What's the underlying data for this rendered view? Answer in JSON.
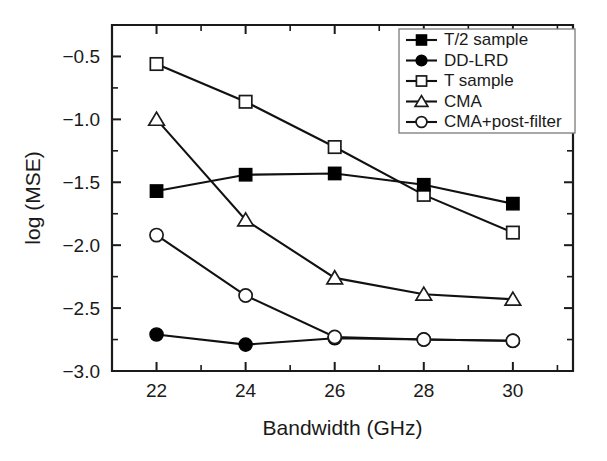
{
  "chart_data": {
    "type": "line",
    "title": "",
    "xlabel": "Bandwidth (GHz)",
    "ylabel": "log (MSE)",
    "x": [
      22,
      24,
      26,
      28,
      30
    ],
    "xtick_labels": [
      "22",
      "24",
      "26",
      "28",
      "30"
    ],
    "ytick_labels": [
      "−0.5",
      "−1.0",
      "−1.5",
      "−2.0",
      "−2.5",
      "−3.0"
    ],
    "ytick_values": [
      -0.5,
      -1.0,
      -1.5,
      -2.0,
      -2.5,
      -3.0
    ],
    "xlim": [
      21.0,
      31.35
    ],
    "ylim": [
      -3.0,
      -0.25
    ],
    "grid": false,
    "legend_position": "top-right",
    "series": [
      {
        "name": "T/2 sample",
        "marker": "filled-square",
        "values": [
          -1.57,
          -1.44,
          -1.43,
          -1.52,
          -1.67
        ]
      },
      {
        "name": "DD-LRD",
        "marker": "filled-circle",
        "values": [
          -2.71,
          -2.79,
          -2.74,
          -2.75,
          -2.76
        ]
      },
      {
        "name": "T sample",
        "marker": "open-square",
        "values": [
          -0.56,
          -0.86,
          -1.22,
          -1.6,
          -1.9
        ]
      },
      {
        "name": "CMA",
        "marker": "open-triangle",
        "values": [
          -1.0,
          -1.8,
          -2.26,
          -2.39,
          -2.43
        ]
      },
      {
        "name": "CMA+post-filter",
        "marker": "open-circle",
        "values": [
          -1.92,
          -2.4,
          -2.73,
          -2.75,
          -2.76
        ]
      }
    ]
  },
  "colors": {
    "axis": "#1a1a1a",
    "line": "#111111",
    "marker_fill": "#000000",
    "marker_open_fill": "#ffffff",
    "background": "#ffffff",
    "legend_border": "#7a7a7a"
  }
}
